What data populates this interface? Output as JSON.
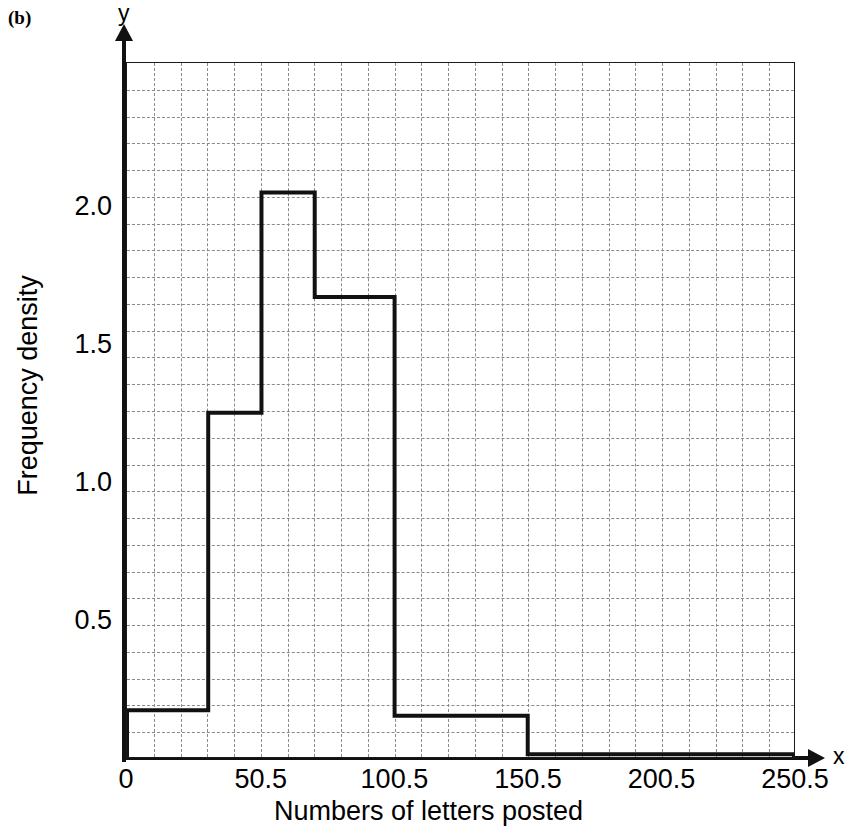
{
  "figure": {
    "part_label": "(b)",
    "y_axis_letter": "y",
    "x_axis_letter": "x"
  },
  "axes": {
    "xlabel": "Numbers of letters posted",
    "ylabel": "Frequency density",
    "xticks": [
      "0",
      "50.5",
      "100.5",
      "150.5",
      "200.5",
      "250.5"
    ],
    "yticks": [
      "0.5",
      "1.0",
      "1.5",
      "2.0"
    ]
  },
  "chart_data": {
    "type": "bar",
    "title": "",
    "xlabel": "Numbers of letters posted",
    "ylabel": "Frequency density",
    "xlim": [
      0,
      250.5
    ],
    "ylim": [
      0,
      2.52
    ],
    "xticks": [
      0,
      50.5,
      100.5,
      150.5,
      200.5,
      250.5
    ],
    "yticks": [
      0.5,
      1.0,
      1.5,
      2.0
    ],
    "grid": true,
    "legend": null,
    "bin_edges": [
      0,
      30.5,
      50.5,
      70.5,
      100.5,
      150.5,
      250.5
    ],
    "values": [
      0.17,
      1.25,
      2.05,
      1.67,
      0.15,
      0.01
    ],
    "bins": [
      {
        "from": 0,
        "to": 30.5,
        "density": 0.17
      },
      {
        "from": 30.5,
        "to": 50.5,
        "density": 1.25
      },
      {
        "from": 50.5,
        "to": 70.5,
        "density": 2.05
      },
      {
        "from": 70.5,
        "to": 100.5,
        "density": 1.67
      },
      {
        "from": 100.5,
        "to": 150.5,
        "density": 0.15
      },
      {
        "from": 150.5,
        "to": 250.5,
        "density": 0.01
      }
    ]
  }
}
